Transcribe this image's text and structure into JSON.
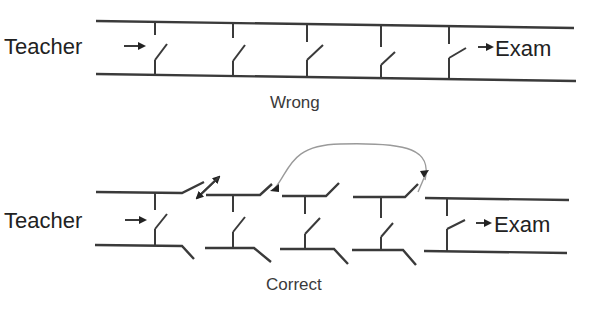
{
  "diagrams": {
    "wrong": {
      "caption": "Wrong",
      "input_label": "Teacher",
      "output_label": "Exam"
    },
    "correct": {
      "caption": "Correct",
      "input_label": "Teacher",
      "output_label": "Exam"
    }
  },
  "colors": {
    "line": "#3a3a3a",
    "arc": "#9a9a9a",
    "background": "#ffffff"
  }
}
